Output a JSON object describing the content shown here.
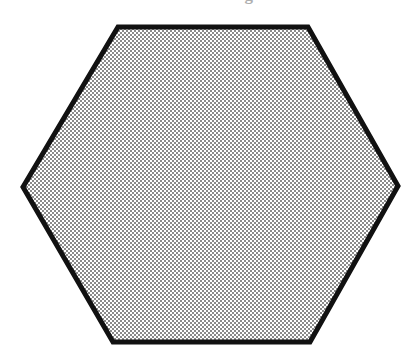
{
  "page": {
    "width": 405,
    "height": 361,
    "background_color": "#ffffff"
  },
  "caption": {
    "text": "the bottom edge.",
    "note": "clipped — only the lower 2-3px of the serif glyphs remain visible at the top of the scan",
    "color": "#6e6e6e"
  },
  "figure": {
    "name": "hexagon",
    "shape_type": "hexagon",
    "sides": 6,
    "orientation": "flat-top",
    "outline_color": "#111111",
    "outline_width": 5,
    "fill_style": "checkerboard-dither-50",
    "fill_color_light": "#ffffff",
    "fill_color_dark": "#8a8a8a",
    "fill_apparent_gray": "#c8c8c8",
    "vertices": [
      {
        "label": "top-left",
        "x": 118,
        "y": 27
      },
      {
        "label": "top-right",
        "x": 308,
        "y": 27
      },
      {
        "label": "right",
        "x": 398,
        "y": 186
      },
      {
        "label": "bottom-right",
        "x": 310,
        "y": 342
      },
      {
        "label": "bottom-left",
        "x": 113,
        "y": 342
      },
      {
        "label": "left",
        "x": 23,
        "y": 187
      }
    ],
    "points_attr": "118,27 308,27 398,186 310,342 113,342 23,187"
  }
}
